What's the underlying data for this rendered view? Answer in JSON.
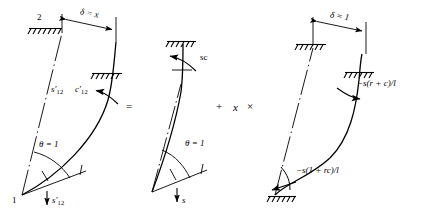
{
  "figure": {
    "type": "structural-frame-superposition-diagram"
  },
  "panels": [
    {
      "id": "left",
      "name": "deformed-frame-theta-and-sway",
      "labels": {
        "node_top": "2",
        "node_bottom": "1",
        "dimension": "δ = x",
        "moment_end_a": "s′",
        "moment_end_a_sub": "12",
        "moment_end_b": "c′",
        "moment_end_b_sub": "12",
        "rotation": "θ = 1",
        "shear": "s′",
        "shear_sub": "12"
      }
    },
    {
      "id": "middle",
      "name": "unit-rotation-case",
      "labels": {
        "moment_top": "sc",
        "rotation": "θ = 1",
        "shear": "s"
      }
    },
    {
      "id": "right",
      "name": "unit-sway-case",
      "labels": {
        "dimension": "δ = 1",
        "moment_top": "−s(r + c)/l",
        "moment_bottom": "−s(1 + rc)/l"
      }
    }
  ],
  "operators": {
    "equals": "=",
    "plus": "+",
    "multiplier": "x",
    "times": "×"
  },
  "colors": {
    "ink": "#000000",
    "background": "#ffffff"
  }
}
